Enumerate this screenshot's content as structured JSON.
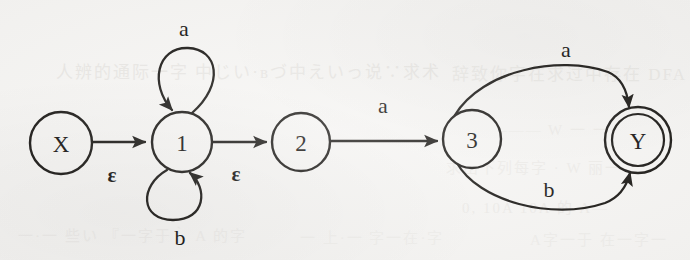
{
  "figure": {
    "kind": "nfa-state-diagram",
    "background_color": "#f6f5f3",
    "ink_color": "#14120f"
  },
  "states": [
    {
      "id": "X",
      "label": "X",
      "cx": 61,
      "cy": 143,
      "r": 31,
      "accepting": false,
      "type": "start"
    },
    {
      "id": "1",
      "label": "1",
      "cx": 182,
      "cy": 142,
      "r": 30,
      "accepting": false,
      "type": "normal"
    },
    {
      "id": "2",
      "label": "2",
      "cx": 301,
      "cy": 142,
      "r": 29,
      "accepting": false,
      "type": "normal"
    },
    {
      "id": "3",
      "label": "3",
      "cx": 472,
      "cy": 139,
      "r": 29,
      "accepting": false,
      "type": "normal"
    },
    {
      "id": "Y",
      "label": "Y",
      "cx": 638,
      "cy": 140,
      "r": 34,
      "accepting": true,
      "type": "final"
    }
  ],
  "transitions": [
    {
      "from": "X",
      "to": "1",
      "label": "ε",
      "label_x": 112,
      "label_y": 175,
      "kind": "straight",
      "symbol_type": "epsilon"
    },
    {
      "from": "1",
      "to": "1",
      "label": "a",
      "label_x": 184,
      "label_y": 28,
      "kind": "self-loop-top",
      "symbol_type": "letter"
    },
    {
      "from": "1",
      "to": "1",
      "label": "b",
      "label_x": 180,
      "label_y": 237,
      "kind": "self-loop-bottom",
      "symbol_type": "letter"
    },
    {
      "from": "1",
      "to": "2",
      "label": "ε",
      "label_x": 236,
      "label_y": 174,
      "kind": "straight",
      "symbol_type": "epsilon"
    },
    {
      "from": "2",
      "to": "3",
      "label": "a",
      "label_x": 383,
      "label_y": 105,
      "kind": "straight",
      "symbol_type": "letter"
    },
    {
      "from": "3",
      "to": "Y",
      "label": "a",
      "label_x": 566,
      "label_y": 49,
      "kind": "curve-upper",
      "symbol_type": "letter"
    },
    {
      "from": "3",
      "to": "Y",
      "label": "b",
      "label_x": 549,
      "label_y": 189,
      "kind": "curve-lower",
      "symbol_type": "letter"
    }
  ],
  "alphabet": [
    "a",
    "b",
    "ε"
  ],
  "start_state": "X",
  "accepting_states": [
    "Y"
  ],
  "bleed_through_text": [
    {
      "text": "人辨的通际一字  中じい·вづ中えいっ说∵求术",
      "x": 56,
      "y": 58,
      "size": 17,
      "opacity": 0.46
    },
    {
      "text": "辞致你字在求过中存在  DFA",
      "x": 452,
      "y": 60,
      "size": 17,
      "opacity": 0.38
    },
    {
      "text": "W ——— W  一  一",
      "x": 470,
      "y": 118,
      "size": 15,
      "opacity": 0.3
    },
    {
      "text": "求出下列每字 · W 丽一",
      "x": 446,
      "y": 156,
      "size": 15,
      "opacity": 0.3
    },
    {
      "text": "0,  10A 10A 的 A—",
      "x": 462,
      "y": 196,
      "size": 15,
      "opacity": 0.32
    },
    {
      "text": "一·一 些い 『一字于‵ A 的字",
      "x": 18,
      "y": 224,
      "size": 15,
      "opacity": 0.26
    },
    {
      "text": "一 上·一 字一在·字",
      "x": 300,
      "y": 226,
      "size": 15,
      "opacity": 0.22
    },
    {
      "text": "A字一于 在一字一",
      "x": 530,
      "y": 228,
      "size": 15,
      "opacity": 0.24
    }
  ]
}
